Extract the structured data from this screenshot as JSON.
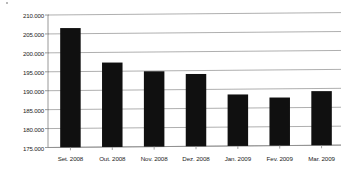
{
  "chart_data": {
    "type": "bar",
    "title": "",
    "subtitle": "",
    "xlabel": "",
    "ylabel": "",
    "categories": [
      "Set. 2008",
      "Out. 2008",
      "Nov. 2008",
      "Dez. 2008",
      "Jan. 2009",
      "Fev. 2009",
      "Mar. 2009"
    ],
    "values": [
      206500,
      197300,
      194900,
      194100,
      188600,
      187700,
      189300
    ],
    "ylim": [
      175000,
      210000
    ],
    "ytick_values": [
      175000,
      180000,
      185000,
      190000,
      195000,
      200000,
      205000,
      210000
    ],
    "ytick_labels": [
      "175.000",
      "180.000",
      "185.000",
      "190.000",
      "195.000",
      "200.000",
      "205.000",
      "210.000"
    ],
    "ytick_step": 5000,
    "grid": true,
    "grid_axis": "y",
    "legend": false,
    "legend_position": "none",
    "bar_color": "#101010",
    "grid_color": "#9a9a9a",
    "axis_color": "#8d8d8d",
    "label_color": "#232323",
    "background_color": "#ffffff",
    "number_format": "dot-thousands-separator",
    "annotations": []
  }
}
